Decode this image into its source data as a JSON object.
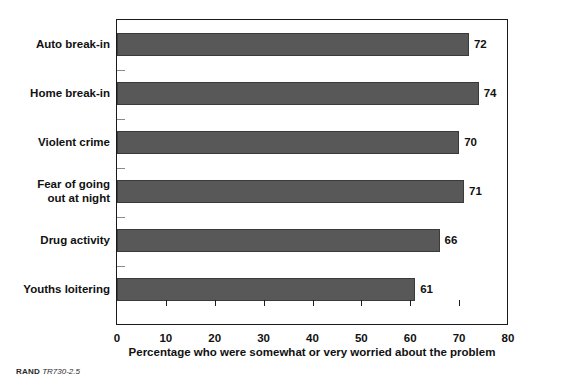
{
  "chart_data": {
    "type": "bar",
    "orientation": "horizontal",
    "title": "",
    "xlabel": "Percentage who were somewhat or very worried about the problem",
    "ylabel": "",
    "xlim": [
      0,
      80
    ],
    "xticks": [
      0,
      10,
      20,
      30,
      40,
      50,
      60,
      70,
      80
    ],
    "xtick_labels": [
      "0",
      "10",
      "20",
      "30",
      "40",
      "50",
      "60",
      "70",
      "80"
    ],
    "grid": false,
    "legend": null,
    "bar_color": "#585858",
    "categories": [
      "Auto break-in",
      "Home break-in",
      "Violent crime",
      "Fear of going out at night",
      "Drug activity",
      "Youths loitering"
    ],
    "category_label_lines": [
      [
        "Auto break-in"
      ],
      [
        "Home break-in"
      ],
      [
        "Violent crime"
      ],
      [
        "Fear of going",
        "out at night"
      ],
      [
        "Drug activity"
      ],
      [
        "Youths loitering"
      ]
    ],
    "values": [
      72,
      74,
      70,
      71,
      66,
      61
    ],
    "value_labels": [
      "72",
      "74",
      "70",
      "71",
      "66",
      "61"
    ]
  },
  "footer": {
    "brand": "RAND",
    "code": "TR730-2.5"
  }
}
